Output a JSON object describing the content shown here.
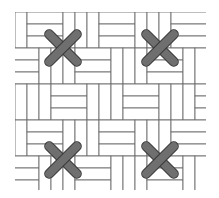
{
  "diagram": {
    "grid": {
      "x0": 15,
      "y0": 12,
      "x1": 206,
      "y1": 190,
      "unit": 12,
      "line_color": "#6e6e6e",
      "fill_color": "#ffffff",
      "pattern": "stepped basketweave: 3-unit horizontal bars and 3-unit vertical bars alternating on a diagonal"
    },
    "stitches": [
      {
        "name": "top-left",
        "cx": 63,
        "cy": 48
      },
      {
        "name": "top-right",
        "cx": 160,
        "cy": 48
      },
      {
        "name": "bottom-left",
        "cx": 63,
        "cy": 160
      },
      {
        "name": "bottom-right",
        "cx": 160,
        "cy": 160
      }
    ],
    "stitch_color": "#6f6f6f",
    "stitch_outline": "#3a3a3a"
  }
}
